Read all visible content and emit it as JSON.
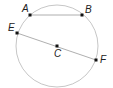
{
  "diagram": {
    "type": "circle-geometry",
    "circle": {
      "center_label": "C",
      "stroke": "#b0b0b0"
    },
    "points": [
      {
        "label": "A",
        "x": 30,
        "y": 15,
        "lx": 22,
        "ly": 12
      },
      {
        "label": "B",
        "x": 82,
        "y": 15,
        "lx": 85,
        "ly": 13
      },
      {
        "label": "E",
        "x": 17,
        "y": 33,
        "lx": 8,
        "ly": 31
      },
      {
        "label": "C",
        "x": 57,
        "y": 46,
        "lx": 54,
        "ly": 57
      },
      {
        "label": "F",
        "x": 96,
        "y": 60,
        "lx": 100,
        "ly": 63
      }
    ],
    "segments": [
      {
        "from": "A",
        "to": "B",
        "kind": "chord"
      },
      {
        "from": "E",
        "to": "F",
        "kind": "diameter"
      }
    ]
  }
}
